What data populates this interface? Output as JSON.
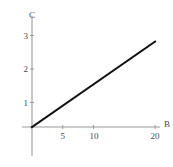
{
  "chart_data": {
    "type": "line",
    "title": "",
    "xlabel": "B",
    "ylabel": "C",
    "xlim": [
      0,
      22
    ],
    "ylim": [
      0,
      3.3
    ],
    "grid": false,
    "legend": null,
    "x_ticks": [
      {
        "value": 5,
        "label": "5"
      },
      {
        "value": 10,
        "label": "10"
      },
      {
        "value": 20,
        "label": "20"
      }
    ],
    "y_ticks": [
      {
        "value": 1,
        "label": "1"
      },
      {
        "value": 2,
        "label": "2"
      },
      {
        "value": 3,
        "label": "3"
      }
    ],
    "series": [
      {
        "name": "C vs B",
        "color": "#111111",
        "x": [
          0,
          20
        ],
        "values": [
          0,
          2.8
        ]
      }
    ]
  },
  "axes": {
    "x_axis_label": "B",
    "y_axis_label": "C",
    "axis_color": "#9a9a9a",
    "line_color": "#111111",
    "text_color": "#4a4a4a"
  }
}
